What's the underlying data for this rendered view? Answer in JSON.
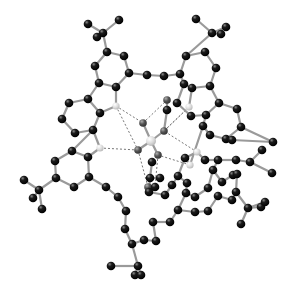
{
  "figure": {
    "type": "ball-and-stick molecular structure",
    "background": "#ffffff",
    "colors": {
      "carbon": "#111111",
      "nitrogen": "#d8d8d8",
      "oxygen": "#555555",
      "center": "#cfcfcf",
      "bond": "#9a9a9a",
      "hbond": "#777777"
    },
    "atoms": [
      {
        "id": "c1",
        "x": 88,
        "y": 24,
        "t": "C"
      },
      {
        "id": "c2",
        "x": 119,
        "y": 20,
        "t": "C"
      },
      {
        "id": "c3",
        "x": 103,
        "y": 33,
        "t": "C"
      },
      {
        "id": "c4",
        "x": 97,
        "y": 37,
        "t": "C"
      },
      {
        "id": "c5",
        "x": 107,
        "y": 52,
        "t": "C"
      },
      {
        "id": "c6",
        "x": 124,
        "y": 56,
        "t": "C"
      },
      {
        "id": "c7",
        "x": 95,
        "y": 66,
        "t": "C"
      },
      {
        "id": "c8",
        "x": 129,
        "y": 73,
        "t": "C"
      },
      {
        "id": "c9",
        "x": 99,
        "y": 83,
        "t": "C"
      },
      {
        "id": "c10",
        "x": 116,
        "y": 87,
        "t": "C"
      },
      {
        "id": "c11",
        "x": 88,
        "y": 99,
        "t": "C"
      },
      {
        "id": "c12",
        "x": 69,
        "y": 103,
        "t": "C"
      },
      {
        "id": "c13",
        "x": 100,
        "y": 113,
        "t": "C"
      },
      {
        "id": "c14",
        "x": 62,
        "y": 119,
        "t": "C"
      },
      {
        "id": "c15",
        "x": 75,
        "y": 133,
        "t": "C"
      },
      {
        "id": "c16",
        "x": 93,
        "y": 130,
        "t": "C"
      },
      {
        "id": "n1",
        "x": 116,
        "y": 106,
        "t": "N"
      },
      {
        "id": "c17",
        "x": 147,
        "y": 75,
        "t": "C"
      },
      {
        "id": "c18",
        "x": 164,
        "y": 76,
        "t": "C"
      },
      {
        "id": "c19",
        "x": 196,
        "y": 19,
        "t": "C"
      },
      {
        "id": "c20",
        "x": 212,
        "y": 33,
        "t": "C"
      },
      {
        "id": "c21",
        "x": 226,
        "y": 27,
        "t": "C"
      },
      {
        "id": "c22",
        "x": 221,
        "y": 34,
        "t": "C"
      },
      {
        "id": "c23",
        "x": 186,
        "y": 56,
        "t": "C"
      },
      {
        "id": "c24",
        "x": 205,
        "y": 52,
        "t": "C"
      },
      {
        "id": "c25",
        "x": 216,
        "y": 68,
        "t": "C"
      },
      {
        "id": "c26",
        "x": 180,
        "y": 74,
        "t": "C"
      },
      {
        "id": "c27",
        "x": 184,
        "y": 84,
        "t": "C"
      },
      {
        "id": "c28",
        "x": 192,
        "y": 88,
        "t": "C"
      },
      {
        "id": "c29",
        "x": 210,
        "y": 86,
        "t": "C"
      },
      {
        "id": "c30",
        "x": 177,
        "y": 103,
        "t": "C"
      },
      {
        "id": "c31",
        "x": 219,
        "y": 103,
        "t": "C"
      },
      {
        "id": "c32",
        "x": 237,
        "y": 109,
        "t": "C"
      },
      {
        "id": "c33",
        "x": 191,
        "y": 116,
        "t": "C"
      },
      {
        "id": "c34",
        "x": 206,
        "y": 115,
        "t": "C"
      },
      {
        "id": "c35",
        "x": 241,
        "y": 127,
        "t": "C"
      },
      {
        "id": "c36",
        "x": 203,
        "y": 126,
        "t": "C"
      },
      {
        "id": "c37",
        "x": 210,
        "y": 135,
        "t": "C"
      },
      {
        "id": "c38",
        "x": 226,
        "y": 139,
        "t": "C"
      },
      {
        "id": "c39",
        "x": 232,
        "y": 140,
        "t": "C"
      },
      {
        "id": "c40",
        "x": 273,
        "y": 142,
        "t": "C"
      },
      {
        "id": "c41",
        "x": 167,
        "y": 100,
        "t": "O"
      },
      {
        "id": "c42",
        "x": 167,
        "y": 110,
        "t": "C"
      },
      {
        "id": "n2",
        "x": 189,
        "y": 107,
        "t": "N"
      },
      {
        "id": "c43",
        "x": 72,
        "y": 151,
        "t": "C"
      },
      {
        "id": "c44",
        "x": 88,
        "y": 157,
        "t": "C"
      },
      {
        "id": "c45",
        "x": 55,
        "y": 161,
        "t": "C"
      },
      {
        "id": "c46",
        "x": 89,
        "y": 177,
        "t": "C"
      },
      {
        "id": "c47",
        "x": 56,
        "y": 178,
        "t": "C"
      },
      {
        "id": "c48",
        "x": 74,
        "y": 187,
        "t": "C"
      },
      {
        "id": "c49",
        "x": 24,
        "y": 180,
        "t": "C"
      },
      {
        "id": "c50",
        "x": 39,
        "y": 190,
        "t": "C"
      },
      {
        "id": "c51",
        "x": 33,
        "y": 198,
        "t": "C"
      },
      {
        "id": "c52",
        "x": 42,
        "y": 209,
        "t": "C"
      },
      {
        "id": "c53",
        "x": 106,
        "y": 187,
        "t": "C"
      },
      {
        "id": "c54",
        "x": 118,
        "y": 197,
        "t": "C"
      },
      {
        "id": "c55",
        "x": 126,
        "y": 211,
        "t": "C"
      },
      {
        "id": "c56",
        "x": 132,
        "y": 244,
        "t": "C"
      },
      {
        "id": "c57",
        "x": 138,
        "y": 266,
        "t": "C"
      },
      {
        "id": "c58",
        "x": 111,
        "y": 266,
        "t": "C"
      },
      {
        "id": "c59",
        "x": 135,
        "y": 275,
        "t": "C"
      },
      {
        "id": "c60",
        "x": 141,
        "y": 275,
        "t": "C"
      },
      {
        "id": "c61",
        "x": 125,
        "y": 229,
        "t": "C"
      },
      {
        "id": "n3",
        "x": 100,
        "y": 148,
        "t": "N"
      },
      {
        "id": "o1",
        "x": 143,
        "y": 123,
        "t": "O"
      },
      {
        "id": "o2",
        "x": 164,
        "y": 131,
        "t": "O"
      },
      {
        "id": "o3",
        "x": 138,
        "y": 150,
        "t": "O"
      },
      {
        "id": "o4",
        "x": 158,
        "y": 155,
        "t": "O"
      },
      {
        "id": "m1",
        "x": 151,
        "y": 141,
        "t": "M"
      },
      {
        "id": "o5",
        "x": 148,
        "y": 187,
        "t": "O"
      },
      {
        "id": "c62",
        "x": 155,
        "y": 187,
        "t": "C"
      },
      {
        "id": "n4",
        "x": 190,
        "y": 165,
        "t": "N"
      },
      {
        "id": "n5",
        "x": 197,
        "y": 152,
        "t": "N"
      },
      {
        "id": "c63",
        "x": 152,
        "y": 162,
        "t": "C"
      },
      {
        "id": "c64",
        "x": 150,
        "y": 178,
        "t": "C"
      },
      {
        "id": "c65",
        "x": 149,
        "y": 192,
        "t": "C"
      },
      {
        "id": "c66",
        "x": 172,
        "y": 185,
        "t": "C"
      },
      {
        "id": "c67",
        "x": 185,
        "y": 158,
        "t": "C"
      },
      {
        "id": "c68",
        "x": 178,
        "y": 176,
        "t": "C"
      },
      {
        "id": "c69",
        "x": 187,
        "y": 183,
        "t": "C"
      },
      {
        "id": "c70",
        "x": 205,
        "y": 160,
        "t": "C"
      },
      {
        "id": "c71",
        "x": 213,
        "y": 170,
        "t": "C"
      },
      {
        "id": "c72",
        "x": 218,
        "y": 160,
        "t": "C"
      },
      {
        "id": "c73",
        "x": 233,
        "y": 175,
        "t": "C"
      },
      {
        "id": "c74",
        "x": 237,
        "y": 174,
        "t": "C"
      },
      {
        "id": "c75",
        "x": 236,
        "y": 160,
        "t": "C"
      },
      {
        "id": "c76",
        "x": 250,
        "y": 162,
        "t": "C"
      },
      {
        "id": "c77",
        "x": 262,
        "y": 150,
        "t": "C"
      },
      {
        "id": "c78",
        "x": 272,
        "y": 173,
        "t": "C"
      },
      {
        "id": "c79",
        "x": 248,
        "y": 208,
        "t": "C"
      },
      {
        "id": "c80",
        "x": 261,
        "y": 207,
        "t": "C"
      },
      {
        "id": "c81",
        "x": 265,
        "y": 202,
        "t": "C"
      },
      {
        "id": "c82",
        "x": 241,
        "y": 224,
        "t": "C"
      },
      {
        "id": "c83",
        "x": 236,
        "y": 192,
        "t": "C"
      },
      {
        "id": "c84",
        "x": 218,
        "y": 196,
        "t": "C"
      },
      {
        "id": "c85",
        "x": 208,
        "y": 211,
        "t": "C"
      },
      {
        "id": "c86",
        "x": 195,
        "y": 212,
        "t": "C"
      },
      {
        "id": "c87",
        "x": 178,
        "y": 210,
        "t": "C"
      },
      {
        "id": "c88",
        "x": 170,
        "y": 222,
        "t": "C"
      },
      {
        "id": "c89",
        "x": 153,
        "y": 222,
        "t": "C"
      },
      {
        "id": "c90",
        "x": 160,
        "y": 178,
        "t": "C"
      },
      {
        "id": "c91",
        "x": 165,
        "y": 195,
        "t": "C"
      },
      {
        "id": "c92",
        "x": 186,
        "y": 193,
        "t": "C"
      },
      {
        "id": "c93",
        "x": 195,
        "y": 197,
        "t": "C"
      },
      {
        "id": "c94",
        "x": 222,
        "y": 182,
        "t": "C"
      },
      {
        "id": "c95",
        "x": 208,
        "y": 188,
        "t": "C"
      },
      {
        "id": "c96",
        "x": 232,
        "y": 200,
        "t": "C"
      },
      {
        "id": "c97",
        "x": 144,
        "y": 240,
        "t": "C"
      },
      {
        "id": "c98",
        "x": 156,
        "y": 241,
        "t": "C"
      }
    ],
    "bonds": [
      [
        "c1",
        "c3"
      ],
      [
        "c2",
        "c3"
      ],
      [
        "c3",
        "c4"
      ],
      [
        "c3",
        "c5"
      ],
      [
        "c5",
        "c6"
      ],
      [
        "c5",
        "c7"
      ],
      [
        "c6",
        "c8"
      ],
      [
        "c7",
        "c9"
      ],
      [
        "c8",
        "c10"
      ],
      [
        "c9",
        "c10"
      ],
      [
        "c8",
        "c17"
      ],
      [
        "c17",
        "c18"
      ],
      [
        "c18",
        "c26"
      ],
      [
        "c9",
        "c11"
      ],
      [
        "c10",
        "n1"
      ],
      [
        "c11",
        "c12"
      ],
      [
        "c11",
        "c13"
      ],
      [
        "c13",
        "n1"
      ],
      [
        "c12",
        "c14"
      ],
      [
        "c14",
        "c15"
      ],
      [
        "c15",
        "c16"
      ],
      [
        "c16",
        "c13"
      ],
      [
        "c19",
        "c20"
      ],
      [
        "c20",
        "c21"
      ],
      [
        "c20",
        "c22"
      ],
      [
        "c20",
        "c23"
      ],
      [
        "c23",
        "c24"
      ],
      [
        "c24",
        "c25"
      ],
      [
        "c23",
        "c26"
      ],
      [
        "c26",
        "c27"
      ],
      [
        "c27",
        "c28"
      ],
      [
        "c28",
        "c29"
      ],
      [
        "c25",
        "c29"
      ],
      [
        "c27",
        "c30"
      ],
      [
        "c28",
        "n2"
      ],
      [
        "c29",
        "c31"
      ],
      [
        "c31",
        "c32"
      ],
      [
        "c32",
        "c35"
      ],
      [
        "c35",
        "c38"
      ],
      [
        "c34",
        "c36"
      ],
      [
        "c36",
        "c37"
      ],
      [
        "c37",
        "c38"
      ],
      [
        "c34",
        "c31"
      ],
      [
        "c33",
        "c34"
      ],
      [
        "c30",
        "c33"
      ],
      [
        "c35",
        "c40"
      ],
      [
        "c39",
        "c40"
      ],
      [
        "c16",
        "c43"
      ],
      [
        "c43",
        "c44"
      ],
      [
        "c43",
        "c45"
      ],
      [
        "c44",
        "n3"
      ],
      [
        "c44",
        "c46"
      ],
      [
        "c45",
        "c47"
      ],
      [
        "c47",
        "c48"
      ],
      [
        "c46",
        "c48"
      ],
      [
        "c47",
        "c50"
      ],
      [
        "c49",
        "c50"
      ],
      [
        "c50",
        "c51"
      ],
      [
        "c50",
        "c52"
      ],
      [
        "c46",
        "c53"
      ],
      [
        "c53",
        "c54"
      ],
      [
        "c54",
        "c55"
      ],
      [
        "c55",
        "c61"
      ],
      [
        "c61",
        "c56"
      ],
      [
        "c56",
        "c57"
      ],
      [
        "c57",
        "c58"
      ],
      [
        "c57",
        "c59"
      ],
      [
        "c57",
        "c60"
      ],
      [
        "c56",
        "c97"
      ],
      [
        "c97",
        "c98"
      ],
      [
        "c98",
        "c89"
      ],
      [
        "n3",
        "c16"
      ],
      [
        "m1",
        "o1"
      ],
      [
        "m1",
        "o2"
      ],
      [
        "m1",
        "o3"
      ],
      [
        "m1",
        "o4"
      ],
      [
        "o5",
        "c62"
      ],
      [
        "c63",
        "c64"
      ],
      [
        "c64",
        "c65"
      ],
      [
        "c65",
        "c91"
      ],
      [
        "c91",
        "c66"
      ],
      [
        "c66",
        "c68"
      ],
      [
        "c68",
        "c67"
      ],
      [
        "c67",
        "n5"
      ],
      [
        "n5",
        "c70"
      ],
      [
        "c70",
        "c72"
      ],
      [
        "c72",
        "c75"
      ],
      [
        "c75",
        "c76"
      ],
      [
        "c76",
        "c77"
      ],
      [
        "c76",
        "c78"
      ],
      [
        "c72",
        "c71"
      ],
      [
        "c71",
        "c94"
      ],
      [
        "c94",
        "c73"
      ],
      [
        "c73",
        "c74"
      ],
      [
        "c74",
        "c83"
      ],
      [
        "c83",
        "c79"
      ],
      [
        "c79",
        "c80"
      ],
      [
        "c79",
        "c81"
      ],
      [
        "c79",
        "c82"
      ],
      [
        "c83",
        "c96"
      ],
      [
        "c96",
        "c84"
      ],
      [
        "c84",
        "c85"
      ],
      [
        "c85",
        "c86"
      ],
      [
        "c86",
        "c87"
      ],
      [
        "c87",
        "c88"
      ],
      [
        "c88",
        "c89"
      ],
      [
        "c92",
        "c93"
      ],
      [
        "c93",
        "c95"
      ],
      [
        "c95",
        "c71"
      ],
      [
        "c68",
        "c69"
      ],
      [
        "c69",
        "c92"
      ],
      [
        "c90",
        "c64"
      ],
      [
        "c87",
        "c92"
      ],
      [
        "n4",
        "c67"
      ],
      [
        "c36",
        "n4"
      ],
      [
        "c41",
        "c42"
      ],
      [
        "c42",
        "o2"
      ]
    ],
    "hbonds": [
      [
        "n1",
        "o1"
      ],
      [
        "n2",
        "o2"
      ],
      [
        "n3",
        "o3"
      ],
      [
        "n4",
        "o4"
      ],
      [
        "o1",
        "c41"
      ],
      [
        "o2",
        "n2"
      ],
      [
        "o3",
        "o5"
      ],
      [
        "o4",
        "c62"
      ],
      [
        "n1",
        "o3"
      ],
      [
        "n5",
        "o2"
      ]
    ]
  }
}
